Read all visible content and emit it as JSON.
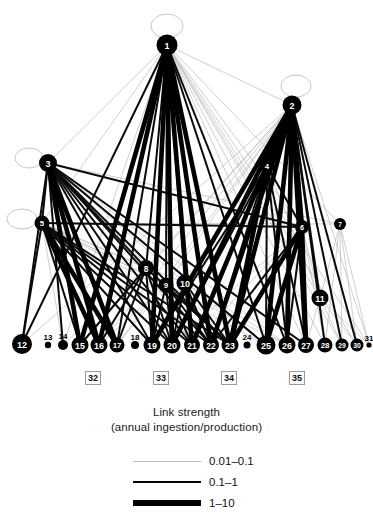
{
  "figure": {
    "type": "network-graph"
  },
  "chart_data": {
    "type": "network",
    "title": "Link strength",
    "subtitle": "(annual ingestion/production)",
    "xlabel": "",
    "ylabel": "",
    "grid": false,
    "legend_position": "bottom-center",
    "nodes": [
      {
        "id": "1",
        "label": "1",
        "x": 167,
        "y": 45,
        "r": 10.5,
        "selfloop": true,
        "loop_dx": 0,
        "loop_dy": -19,
        "loop_rx": 16,
        "loop_ry": 12
      },
      {
        "id": "2",
        "label": "2",
        "x": 292,
        "y": 105,
        "r": 9.5,
        "selfloop": true,
        "loop_dx": 4,
        "loop_dy": -19,
        "loop_rx": 15,
        "loop_ry": 11
      },
      {
        "id": "3",
        "label": "3",
        "x": 48,
        "y": 163,
        "r": 9.0,
        "selfloop": true,
        "loop_dx": -19,
        "loop_dy": -5,
        "loop_rx": 14,
        "loop_ry": 10
      },
      {
        "id": "4",
        "label": "4",
        "x": 267,
        "y": 166,
        "r": 7.5,
        "selfloop": false
      },
      {
        "id": "5",
        "label": "5",
        "x": 42,
        "y": 223,
        "r": 7.5,
        "selfloop": true,
        "loop_dx": -20,
        "loop_dy": -4,
        "loop_rx": 15,
        "loop_ry": 10
      },
      {
        "id": "6",
        "label": "6",
        "x": 302,
        "y": 227,
        "r": 7.0,
        "selfloop": false
      },
      {
        "id": "7",
        "label": "7",
        "x": 340,
        "y": 224,
        "r": 6.0,
        "selfloop": false
      },
      {
        "id": "8",
        "label": "8",
        "x": 146,
        "y": 268,
        "r": 8.0,
        "selfloop": false
      },
      {
        "id": "9",
        "label": "9",
        "x": 166,
        "y": 285,
        "r": 7.5,
        "selfloop": false
      },
      {
        "id": "10",
        "label": "10",
        "x": 185,
        "y": 283,
        "r": 8.5,
        "selfloop": false
      },
      {
        "id": "11",
        "label": "11",
        "x": 320,
        "y": 298,
        "r": 8.5,
        "selfloop": false
      },
      {
        "id": "12",
        "label": "12",
        "x": 22,
        "y": 344,
        "r": 10.0,
        "selfloop": false
      },
      {
        "id": "13",
        "label": "13",
        "x": 48,
        "y": 345,
        "r": 3.2,
        "selfloop": false
      },
      {
        "id": "14",
        "label": "14",
        "x": 63,
        "y": 345,
        "r": 5.0,
        "selfloop": false
      },
      {
        "id": "15",
        "label": "15",
        "x": 80,
        "y": 345,
        "r": 8.5,
        "selfloop": false
      },
      {
        "id": "16",
        "label": "16",
        "x": 99,
        "y": 345,
        "r": 8.5,
        "selfloop": false
      },
      {
        "id": "17",
        "label": "17",
        "x": 117,
        "y": 345,
        "r": 7.5,
        "selfloop": false
      },
      {
        "id": "18",
        "label": "18",
        "x": 135,
        "y": 345,
        "r": 4.0,
        "selfloop": false
      },
      {
        "id": "19",
        "label": "19",
        "x": 152,
        "y": 345,
        "r": 8.5,
        "selfloop": false
      },
      {
        "id": "20",
        "label": "20",
        "x": 172,
        "y": 345,
        "r": 8.5,
        "selfloop": false
      },
      {
        "id": "21",
        "label": "21",
        "x": 192,
        "y": 345,
        "r": 8.0,
        "selfloop": false
      },
      {
        "id": "22",
        "label": "22",
        "x": 211,
        "y": 345,
        "r": 8.0,
        "selfloop": false
      },
      {
        "id": "23",
        "label": "23",
        "x": 230,
        "y": 345,
        "r": 8.5,
        "selfloop": false
      },
      {
        "id": "24",
        "label": "24",
        "x": 247,
        "y": 345,
        "r": 3.5,
        "selfloop": false
      },
      {
        "id": "25",
        "label": "25",
        "x": 266,
        "y": 345,
        "r": 9.5,
        "selfloop": false
      },
      {
        "id": "26",
        "label": "26",
        "x": 287,
        "y": 345,
        "r": 8.5,
        "selfloop": false
      },
      {
        "id": "27",
        "label": "27",
        "x": 306,
        "y": 345,
        "r": 8.0,
        "selfloop": false
      },
      {
        "id": "28",
        "label": "28",
        "x": 325,
        "y": 345,
        "r": 7.5,
        "selfloop": false
      },
      {
        "id": "29",
        "label": "29",
        "x": 342,
        "y": 345,
        "r": 6.5,
        "selfloop": false
      },
      {
        "id": "30",
        "label": "30",
        "x": 357,
        "y": 345,
        "r": 6.5,
        "selfloop": false
      },
      {
        "id": "31",
        "label": "31",
        "x": 369,
        "y": 345,
        "r": 2.6,
        "selfloop": false
      }
    ],
    "boxed_labels": [
      {
        "label": "32",
        "x": 85,
        "y": 371
      },
      {
        "label": "33",
        "x": 153,
        "y": 371
      },
      {
        "label": "34",
        "x": 221,
        "y": 371
      },
      {
        "label": "35",
        "x": 289,
        "y": 371
      }
    ],
    "legend": {
      "title": "Link strength",
      "subtitle": "(annual ingestion/production)",
      "entries": [
        {
          "label": "0.01–0.1",
          "style": "thin",
          "color": "#bdbdbd",
          "width_px": 1
        },
        {
          "label": "0.1–1",
          "style": "med",
          "color": "#050505",
          "width_px": 2.5
        },
        {
          "label": "1–10",
          "style": "thick",
          "color": "#000000",
          "width_px": 6
        }
      ]
    },
    "links": [
      {
        "s": "1",
        "t": "12",
        "w": "med"
      },
      {
        "s": "1",
        "t": "15",
        "w": "thick"
      },
      {
        "s": "1",
        "t": "16",
        "w": "thick"
      },
      {
        "s": "1",
        "t": "17",
        "w": "med"
      },
      {
        "s": "1",
        "t": "19",
        "w": "thick"
      },
      {
        "s": "1",
        "t": "20",
        "w": "thick"
      },
      {
        "s": "1",
        "t": "21",
        "w": "thick"
      },
      {
        "s": "1",
        "t": "22",
        "w": "thick"
      },
      {
        "s": "1",
        "t": "23",
        "w": "thick"
      },
      {
        "s": "1",
        "t": "25",
        "w": "med"
      },
      {
        "s": "1",
        "t": "26",
        "w": "med"
      },
      {
        "s": "1",
        "t": "27",
        "w": "thin"
      },
      {
        "s": "1",
        "t": "14",
        "w": "thin"
      },
      {
        "s": "1",
        "t": "28",
        "w": "thin"
      },
      {
        "s": "1",
        "t": "29",
        "w": "thin"
      },
      {
        "s": "1",
        "t": "30",
        "w": "thin"
      },
      {
        "s": "1",
        "t": "31",
        "w": "thin"
      },
      {
        "s": "1",
        "t": "8",
        "w": "med"
      },
      {
        "s": "1",
        "t": "9",
        "w": "med"
      },
      {
        "s": "1",
        "t": "10",
        "w": "med"
      },
      {
        "s": "1",
        "t": "3",
        "w": "thin"
      },
      {
        "s": "1",
        "t": "2",
        "w": "thin"
      },
      {
        "s": "1",
        "t": "5",
        "w": "thin"
      },
      {
        "s": "1",
        "t": "6",
        "w": "thin"
      },
      {
        "s": "1",
        "t": "7",
        "w": "thin"
      },
      {
        "s": "1",
        "t": "11",
        "w": "thin"
      },
      {
        "s": "2",
        "t": "19",
        "w": "thick"
      },
      {
        "s": "2",
        "t": "20",
        "w": "thick"
      },
      {
        "s": "2",
        "t": "21",
        "w": "thick"
      },
      {
        "s": "2",
        "t": "22",
        "w": "thick"
      },
      {
        "s": "2",
        "t": "23",
        "w": "thick"
      },
      {
        "s": "2",
        "t": "25",
        "w": "thick"
      },
      {
        "s": "2",
        "t": "26",
        "w": "thick"
      },
      {
        "s": "2",
        "t": "27",
        "w": "thick"
      },
      {
        "s": "2",
        "t": "28",
        "w": "med"
      },
      {
        "s": "2",
        "t": "29",
        "w": "med"
      },
      {
        "s": "2",
        "t": "30",
        "w": "med"
      },
      {
        "s": "2",
        "t": "11",
        "w": "med"
      },
      {
        "s": "2",
        "t": "6",
        "w": "thick"
      },
      {
        "s": "2",
        "t": "4",
        "w": "med"
      },
      {
        "s": "2",
        "t": "15",
        "w": "thin"
      },
      {
        "s": "2",
        "t": "16",
        "w": "thin"
      },
      {
        "s": "2",
        "t": "17",
        "w": "thin"
      },
      {
        "s": "2",
        "t": "12",
        "w": "thin"
      },
      {
        "s": "2",
        "t": "8",
        "w": "thin"
      },
      {
        "s": "2",
        "t": "9",
        "w": "thin"
      },
      {
        "s": "2",
        "t": "10",
        "w": "thin"
      },
      {
        "s": "2",
        "t": "31",
        "w": "thin"
      },
      {
        "s": "3",
        "t": "12",
        "w": "med"
      },
      {
        "s": "3",
        "t": "14",
        "w": "med"
      },
      {
        "s": "3",
        "t": "15",
        "w": "thick"
      },
      {
        "s": "3",
        "t": "16",
        "w": "thick"
      },
      {
        "s": "3",
        "t": "17",
        "w": "thick"
      },
      {
        "s": "3",
        "t": "19",
        "w": "med"
      },
      {
        "s": "3",
        "t": "20",
        "w": "med"
      },
      {
        "s": "3",
        "t": "21",
        "w": "med"
      },
      {
        "s": "3",
        "t": "22",
        "w": "med"
      },
      {
        "s": "3",
        "t": "23",
        "w": "med"
      },
      {
        "s": "3",
        "t": "25",
        "w": "med"
      },
      {
        "s": "3",
        "t": "26",
        "w": "thin"
      },
      {
        "s": "3",
        "t": "27",
        "w": "med"
      },
      {
        "s": "3",
        "t": "8",
        "w": "med"
      },
      {
        "s": "3",
        "t": "9",
        "w": "thin"
      },
      {
        "s": "3",
        "t": "10",
        "w": "thin"
      },
      {
        "s": "3",
        "t": "5",
        "w": "med"
      },
      {
        "s": "3",
        "t": "6",
        "w": "med"
      },
      {
        "s": "3",
        "t": "7",
        "w": "thin"
      },
      {
        "s": "4",
        "t": "19",
        "w": "med"
      },
      {
        "s": "4",
        "t": "20",
        "w": "med"
      },
      {
        "s": "4",
        "t": "22",
        "w": "med"
      },
      {
        "s": "4",
        "t": "23",
        "w": "thick"
      },
      {
        "s": "4",
        "t": "25",
        "w": "med"
      },
      {
        "s": "4",
        "t": "26",
        "w": "med"
      },
      {
        "s": "4",
        "t": "27",
        "w": "med"
      },
      {
        "s": "4",
        "t": "11",
        "w": "thin"
      },
      {
        "s": "4",
        "t": "6",
        "w": "med"
      },
      {
        "s": "5",
        "t": "12",
        "w": "med"
      },
      {
        "s": "5",
        "t": "15",
        "w": "med"
      },
      {
        "s": "5",
        "t": "16",
        "w": "thick"
      },
      {
        "s": "5",
        "t": "17",
        "w": "thick"
      },
      {
        "s": "5",
        "t": "19",
        "w": "med"
      },
      {
        "s": "5",
        "t": "20",
        "w": "med"
      },
      {
        "s": "5",
        "t": "21",
        "w": "med"
      },
      {
        "s": "5",
        "t": "22",
        "w": "med"
      },
      {
        "s": "5",
        "t": "23",
        "w": "med"
      },
      {
        "s": "5",
        "t": "14",
        "w": "thin"
      },
      {
        "s": "5",
        "t": "8",
        "w": "thin"
      },
      {
        "s": "5",
        "t": "9",
        "w": "thin"
      },
      {
        "s": "5",
        "t": "10",
        "w": "thin"
      },
      {
        "s": "5",
        "t": "6",
        "w": "med"
      },
      {
        "s": "5",
        "t": "7",
        "w": "thin"
      },
      {
        "s": "5",
        "t": "25",
        "w": "thin"
      },
      {
        "s": "5",
        "t": "26",
        "w": "thin"
      },
      {
        "s": "6",
        "t": "23",
        "w": "thick"
      },
      {
        "s": "6",
        "t": "25",
        "w": "thick"
      },
      {
        "s": "6",
        "t": "26",
        "w": "med"
      },
      {
        "s": "6",
        "t": "27",
        "w": "thick"
      },
      {
        "s": "6",
        "t": "22",
        "w": "med"
      },
      {
        "s": "6",
        "t": "20",
        "w": "thin"
      },
      {
        "s": "6",
        "t": "21",
        "w": "thin"
      },
      {
        "s": "6",
        "t": "11",
        "w": "thin"
      },
      {
        "s": "6",
        "t": "28",
        "w": "thin"
      },
      {
        "s": "7",
        "t": "28",
        "w": "thin"
      },
      {
        "s": "7",
        "t": "29",
        "w": "thin"
      },
      {
        "s": "7",
        "t": "30",
        "w": "thin"
      },
      {
        "s": "7",
        "t": "31",
        "w": "thin"
      },
      {
        "s": "7",
        "t": "11",
        "w": "thin"
      },
      {
        "s": "8",
        "t": "15",
        "w": "med"
      },
      {
        "s": "8",
        "t": "16",
        "w": "med"
      },
      {
        "s": "8",
        "t": "17",
        "w": "med"
      },
      {
        "s": "8",
        "t": "19",
        "w": "med"
      },
      {
        "s": "8",
        "t": "20",
        "w": "med"
      },
      {
        "s": "8",
        "t": "21",
        "w": "thin"
      },
      {
        "s": "8",
        "t": "22",
        "w": "thin"
      },
      {
        "s": "8",
        "t": "23",
        "w": "med"
      },
      {
        "s": "8",
        "t": "14",
        "w": "thin"
      },
      {
        "s": "9",
        "t": "19",
        "w": "med"
      },
      {
        "s": "9",
        "t": "20",
        "w": "med"
      },
      {
        "s": "9",
        "t": "21",
        "w": "med"
      },
      {
        "s": "9",
        "t": "22",
        "w": "med"
      },
      {
        "s": "9",
        "t": "23",
        "w": "med"
      },
      {
        "s": "9",
        "t": "16",
        "w": "thin"
      },
      {
        "s": "9",
        "t": "17",
        "w": "thin"
      },
      {
        "s": "10",
        "t": "20",
        "w": "med"
      },
      {
        "s": "10",
        "t": "21",
        "w": "med"
      },
      {
        "s": "10",
        "t": "22",
        "w": "med"
      },
      {
        "s": "10",
        "t": "23",
        "w": "med"
      },
      {
        "s": "10",
        "t": "25",
        "w": "thin"
      },
      {
        "s": "10",
        "t": "26",
        "w": "thin"
      },
      {
        "s": "10",
        "t": "19",
        "w": "thin"
      },
      {
        "s": "11",
        "t": "28",
        "w": "thin"
      },
      {
        "s": "11",
        "t": "29",
        "w": "thin"
      },
      {
        "s": "11",
        "t": "30",
        "w": "thin"
      },
      {
        "s": "11",
        "t": "31",
        "w": "thin"
      },
      {
        "s": "11",
        "t": "27",
        "w": "thin"
      }
    ]
  }
}
